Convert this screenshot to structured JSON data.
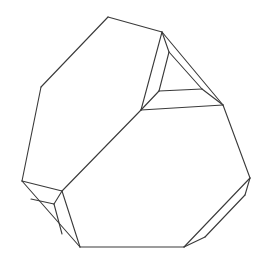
{
  "figure": {
    "stroke_color": "#3a3a3a",
    "background_color": "#ffffff",
    "faces": [
      "large-upper-left-face",
      "large-lower-right-face",
      "top-right-triangular-facet",
      "top-right-bevel-facets",
      "bottom-left-bevel-facets",
      "bottom-right-bevel-facet"
    ]
  }
}
